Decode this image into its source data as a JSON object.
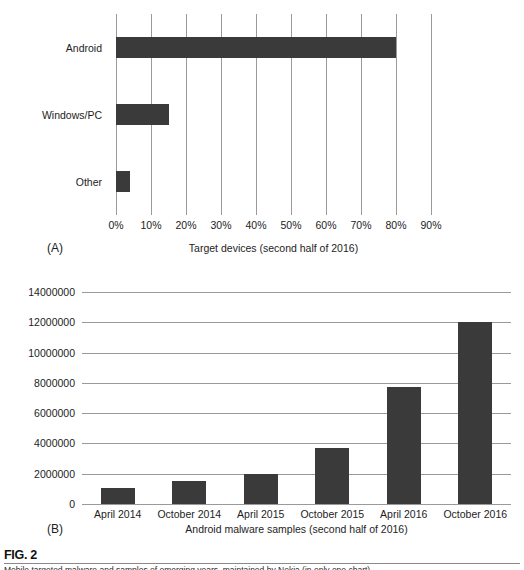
{
  "figure": {
    "number_label": "FIG. 2",
    "caption": "Mobile targeted malware and samples of emerging years, maintained by Nokia (in only one chart)."
  },
  "panel_a": {
    "tag": "(A)",
    "axis_title": "Target devices (second half of 2016)"
  },
  "panel_b": {
    "tag": "(B)",
    "axis_title": "Android malware samples (second half of 2016)"
  },
  "chart_data": [
    {
      "type": "bar",
      "orientation": "horizontal",
      "panel": "(A)",
      "title": "",
      "xlabel": "Target devices (second half of 2016)",
      "ylabel": "",
      "categories": [
        "Android",
        "Windows/PC",
        "Other"
      ],
      "values": [
        80,
        15,
        4
      ],
      "value_unit": "%",
      "xlim": [
        0,
        90
      ],
      "xticks": [
        0,
        10,
        20,
        30,
        40,
        50,
        60,
        70,
        80,
        90
      ],
      "xtick_labels": [
        "0%",
        "10%",
        "20%",
        "30%",
        "40%",
        "50%",
        "60%",
        "70%",
        "80%",
        "90%"
      ],
      "grid": "vertical",
      "legend": "none",
      "bar_color": "#3a3a3a"
    },
    {
      "type": "bar",
      "orientation": "vertical",
      "panel": "(B)",
      "title": "",
      "xlabel": "Android malware samples (second half of 2016)",
      "ylabel": "",
      "categories": [
        "April 2014",
        "October 2014",
        "April 2015",
        "October 2015",
        "April 2016",
        "October 2016"
      ],
      "values": [
        1050000,
        1500000,
        1950000,
        3700000,
        7700000,
        12000000
      ],
      "ylim": [
        0,
        14000000
      ],
      "yticks": [
        0,
        2000000,
        4000000,
        6000000,
        8000000,
        10000000,
        12000000,
        14000000
      ],
      "ytick_labels": [
        "0",
        "2000000",
        "4000000",
        "6000000",
        "8000000",
        "10000000",
        "12000000",
        "14000000"
      ],
      "grid": "horizontal",
      "legend": "none",
      "bar_color": "#3a3a3a"
    }
  ]
}
